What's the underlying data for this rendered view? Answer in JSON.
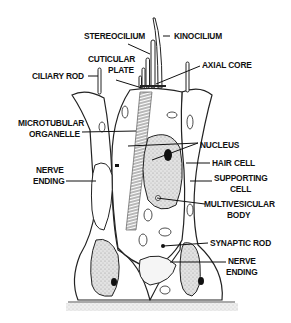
{
  "diagram": {
    "type": "labeled anatomical illustration",
    "labels": {
      "stereocilium": "STEREOCILIUM",
      "kinocilium": "KINOCILIUM",
      "cuticular_plate_1": "CUTICULAR",
      "cuticular_plate_2": "PLATE",
      "axial_core": "AXIAL CORE",
      "ciliary_rod": "CILIARY ROD",
      "microtubular_organelle_1": "MICROTUBULAR",
      "microtubular_organelle_2": "ORGANELLE",
      "nucleus": "NUCLEUS",
      "hair_cell": "HAIR CELL",
      "nerve_ending_left_1": "NERVE",
      "nerve_ending_left_2": "ENDING",
      "supporting_cell_1": "SUPPORTING",
      "supporting_cell_2": "CELL",
      "multivesicular_body_1": "MULTIVESICULAR",
      "multivesicular_body_2": "BODY",
      "synaptic_rod": "SYNAPTIC ROD",
      "nerve_ending_right_1": "NERVE",
      "nerve_ending_right_2": "ENDING"
    },
    "colors": {
      "ink": "#111111",
      "stipple": "#cfcfcf",
      "background": "#ffffff"
    }
  }
}
